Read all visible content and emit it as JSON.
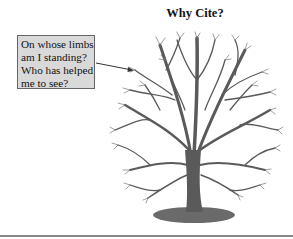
{
  "slide": {
    "title": "Why Cite?",
    "callout": {
      "lines": [
        "On whose limbs",
        "am I standing?",
        "Who has helped",
        "me to see?"
      ]
    },
    "illustration": "bare-tree-image",
    "colors": {
      "callout_bg": "#d9d9d9",
      "tree": "#5a5a5a",
      "rule": "#888888"
    }
  }
}
